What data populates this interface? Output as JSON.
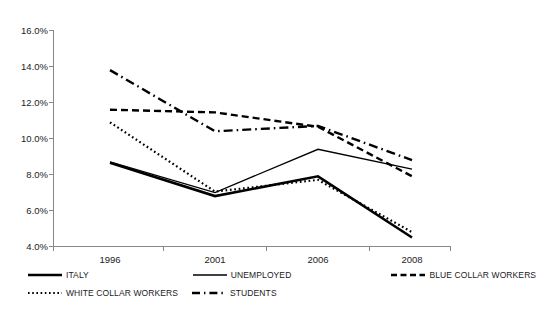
{
  "chart_data": {
    "type": "line",
    "title": "",
    "xlabel": "",
    "ylabel": "",
    "categories": [
      "1996",
      "2001",
      "2006",
      "2008"
    ],
    "ylim": [
      4.0,
      16.0
    ],
    "ytick_values": [
      4.0,
      6.0,
      8.0,
      10.0,
      12.0,
      14.0,
      16.0
    ],
    "ytick_labels": [
      "4.0%",
      "6.0%",
      "8.0%",
      "10.0%",
      "12.0%",
      "14.0%",
      "16.0%"
    ],
    "grid": false,
    "legend_position": "bottom",
    "series": [
      {
        "name": "ITALY",
        "style": "solid-thick",
        "values": [
          8.65,
          6.8,
          7.9,
          4.5
        ]
      },
      {
        "name": "UNEMPLOYED",
        "style": "solid-thin",
        "values": [
          8.7,
          7.0,
          9.4,
          8.3
        ]
      },
      {
        "name": "BLUE COLLAR WORKERS",
        "style": "dashed",
        "values": [
          11.6,
          11.45,
          10.65,
          7.9
        ]
      },
      {
        "name": "WHITE COLLAR WORKERS",
        "style": "dotted",
        "values": [
          10.9,
          7.05,
          7.7,
          4.8
        ]
      },
      {
        "name": "STUDENTS",
        "style": "dash-dot",
        "values": [
          13.8,
          10.4,
          10.7,
          8.8
        ]
      }
    ]
  },
  "axis": {
    "ticks_y": [
      "16.0%",
      "14.0%",
      "12.0%",
      "10.0%",
      "8.0%",
      "6.0%",
      "4.0%"
    ],
    "ticks_x": [
      "1996",
      "2001",
      "2006",
      "2008"
    ]
  },
  "legend": {
    "entries": [
      {
        "label": "ITALY",
        "style": "solid-thick"
      },
      {
        "label": "UNEMPLOYED",
        "style": "solid-thin"
      },
      {
        "label": "BLUE COLLAR WORKERS",
        "style": "dashed"
      },
      {
        "label": "WHITE COLLAR WORKERS",
        "style": "dotted"
      },
      {
        "label": "STUDENTS",
        "style": "dash-dot"
      }
    ]
  },
  "colors": {
    "line": "#000000",
    "axis": "#888888",
    "text": "#1a1a1a",
    "background": "#ffffff"
  }
}
